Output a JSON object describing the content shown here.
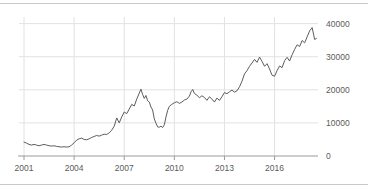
{
  "figure": {
    "top_rule": "divider",
    "bottom_rule": "divider"
  },
  "chart_data": {
    "type": "line",
    "title": "",
    "subtitle": "",
    "xlabel": "",
    "ylabel": "",
    "xlim": [
      2000.7,
      2018.6
    ],
    "ylim": [
      0,
      42000
    ],
    "grid": true,
    "legend": false,
    "legend_position": "none",
    "y_axis_position": "right",
    "line_color": "#5c5c5c",
    "grid_color": "#e2e2e2",
    "axis_color": "#9a9a9a",
    "tick_label_color": "#5a5a5a",
    "xticks": [
      2001,
      2004,
      2007,
      2010,
      2013,
      2016
    ],
    "xtick_labels": [
      "2001",
      "2004",
      "2007",
      "2010",
      "2013",
      "2016"
    ],
    "yticks": [
      0,
      10000,
      20000,
      30000,
      40000
    ],
    "ytick_labels": [
      "0",
      "10000",
      "20000",
      "30000",
      "40000"
    ],
    "series": [
      {
        "name": "index",
        "x": [
          2001.0,
          2001.15,
          2001.3,
          2001.45,
          2001.6,
          2001.75,
          2001.9,
          2002.05,
          2002.2,
          2002.35,
          2002.5,
          2002.65,
          2002.8,
          2002.95,
          2003.1,
          2003.25,
          2003.4,
          2003.55,
          2003.7,
          2003.85,
          2004.0,
          2004.15,
          2004.3,
          2004.45,
          2004.6,
          2004.75,
          2004.9,
          2005.05,
          2005.2,
          2005.35,
          2005.5,
          2005.65,
          2005.8,
          2005.95,
          2006.1,
          2006.25,
          2006.4,
          2006.55,
          2006.7,
          2006.85,
          2007.0,
          2007.15,
          2007.3,
          2007.45,
          2007.6,
          2007.75,
          2007.9,
          2008.0,
          2008.1,
          2008.2,
          2008.3,
          2008.4,
          2008.5,
          2008.6,
          2008.7,
          2008.8,
          2008.9,
          2009.0,
          2009.1,
          2009.2,
          2009.3,
          2009.4,
          2009.5,
          2009.6,
          2009.7,
          2009.85,
          2010.0,
          2010.15,
          2010.3,
          2010.45,
          2010.6,
          2010.75,
          2010.9,
          2011.0,
          2011.1,
          2011.2,
          2011.35,
          2011.5,
          2011.65,
          2011.8,
          2011.95,
          2012.1,
          2012.25,
          2012.4,
          2012.55,
          2012.7,
          2012.85,
          2013.0,
          2013.15,
          2013.3,
          2013.45,
          2013.6,
          2013.75,
          2013.9,
          2014.05,
          2014.2,
          2014.35,
          2014.5,
          2014.65,
          2014.8,
          2014.95,
          2015.1,
          2015.25,
          2015.4,
          2015.55,
          2015.7,
          2015.85,
          2016.0,
          2016.15,
          2016.3,
          2016.45,
          2016.6,
          2016.75,
          2016.9,
          2017.05,
          2017.2,
          2017.35,
          2017.5,
          2017.65,
          2017.8,
          2017.95,
          2018.1,
          2018.25,
          2018.4,
          2018.5
        ],
        "values": [
          4200,
          3900,
          3500,
          3300,
          3500,
          3300,
          3100,
          3300,
          3500,
          3300,
          3100,
          3000,
          3100,
          2900,
          2800,
          2700,
          2800,
          2700,
          2800,
          3300,
          4000,
          4800,
          5200,
          5400,
          5000,
          4900,
          5200,
          5600,
          5900,
          6200,
          6000,
          6300,
          6600,
          6500,
          7000,
          7800,
          9000,
          11500,
          10000,
          11800,
          13300,
          12800,
          14200,
          15600,
          15100,
          17200,
          19000,
          20200,
          18600,
          17400,
          18300,
          16700,
          16300,
          14800,
          13900,
          11200,
          9900,
          8800,
          8700,
          9000,
          8600,
          9400,
          11800,
          13800,
          15000,
          15600,
          16100,
          16400,
          15900,
          16300,
          16900,
          17200,
          18100,
          19400,
          20100,
          18900,
          18400,
          17600,
          18200,
          17700,
          16800,
          17900,
          17200,
          16300,
          17500,
          16800,
          17900,
          19200,
          18800,
          19400,
          19900,
          19300,
          19700,
          20900,
          22600,
          24800,
          25800,
          27100,
          28100,
          29200,
          28300,
          29900,
          28600,
          27100,
          27900,
          26300,
          24400,
          24100,
          25800,
          27200,
          26700,
          28800,
          29800,
          28700,
          30600,
          32200,
          33600,
          33100,
          34900,
          34200,
          36000,
          37800,
          38800,
          35200,
          35500
        ]
      }
    ],
    "annotations": []
  }
}
